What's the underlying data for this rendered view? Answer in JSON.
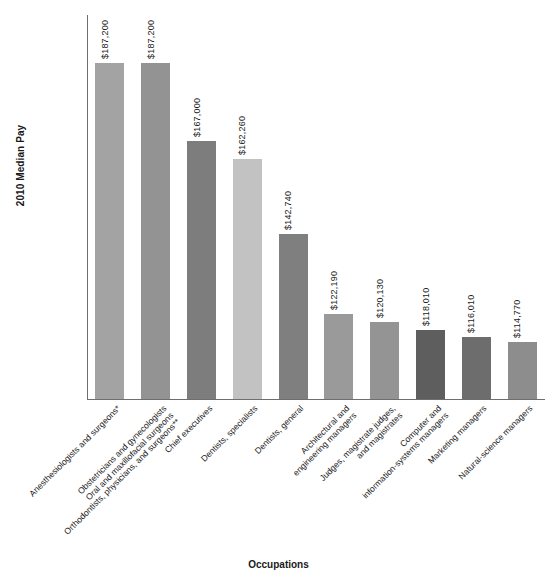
{
  "chart_data": {
    "type": "bar",
    "title": "",
    "xlabel": "Occupations",
    "ylabel": "2010 Median Pay",
    "ylim": [
      100000,
      200000
    ],
    "grid": false,
    "legend": "none",
    "ytick_labels": [
      "$200,000",
      "$190,000",
      "$180,000",
      "$170,000",
      "$160,000",
      "$150,000",
      "$140,000",
      "$130,000",
      "$120,000",
      "$110,000",
      "$100,000"
    ],
    "ytick_values": [
      200000,
      190000,
      180000,
      170000,
      160000,
      150000,
      140000,
      130000,
      120000,
      110000,
      100000
    ],
    "categories": [
      "Anesthesiologists and surgeons*",
      "Obstetricians and gynecologists",
      "Oral and maxillofacial surgeons",
      "Orthodontists, physicians, and surgeons**",
      "Chief executives",
      "Dentists, specialists",
      "Dentists, general",
      "Architectural and\nengineering managers",
      "Judges, magistrate judges,\nand magistrates",
      "Computer and\ninformation-systems managers",
      "Marketing managers",
      "Natural-science managers"
    ],
    "bars": [
      {
        "label_lines": [
          "Anesthesiologists and surgeons*"
        ],
        "value": 187200,
        "value_label": "$187,200",
        "color": "#a3a3a3"
      },
      {
        "label_lines": [
          "Obstetricians and gynecologists",
          "Oral and maxillofacial surgeons",
          "Orthodontists, physicians, and surgeons**"
        ],
        "value": 187200,
        "value_label": "$187,200",
        "color": "#939393"
      },
      {
        "label_lines": [
          "Chief executives"
        ],
        "value": 167000,
        "value_label": "$167,000",
        "color": "#7d7d7d"
      },
      {
        "label_lines": [
          "Dentists, specialists"
        ],
        "value": 162260,
        "value_label": "$162,260",
        "color": "#c2c2c2"
      },
      {
        "label_lines": [
          "Dentists, general"
        ],
        "value": 142740,
        "value_label": "$142,740",
        "color": "#7f7f7f"
      },
      {
        "label_lines": [
          "Architectural and",
          "engineering managers"
        ],
        "value": 122190,
        "value_label": "$122,190",
        "color": "#9a9a9a"
      },
      {
        "label_lines": [
          "Judges, magistrate judges,",
          "and magistrates"
        ],
        "value": 120130,
        "value_label": "$120,130",
        "color": "#949494"
      },
      {
        "label_lines": [
          "Computer and",
          "information-systems managers"
        ],
        "value": 118010,
        "value_label": "$118,010",
        "color": "#5e5e5e"
      },
      {
        "label_lines": [
          "Marketing managers"
        ],
        "value": 116010,
        "value_label": "$116,010",
        "color": "#6d6d6d"
      },
      {
        "label_lines": [
          "Natural-science managers"
        ],
        "value": 114770,
        "value_label": "$114,770",
        "color": "#8d8d8d"
      }
    ]
  }
}
